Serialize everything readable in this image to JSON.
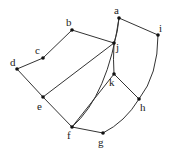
{
  "diagram": {
    "type": "graph",
    "colors": {
      "edge": "#333333",
      "node": "#111111",
      "label": "#222222",
      "background": "#ffffff"
    },
    "nodes": [
      {
        "id": "a",
        "label": "a",
        "x": 119,
        "y": 18,
        "lx": 114,
        "ly": 14
      },
      {
        "id": "b",
        "label": "b",
        "x": 72,
        "y": 30,
        "lx": 66,
        "ly": 26
      },
      {
        "id": "c",
        "label": "c",
        "x": 43,
        "y": 58,
        "lx": 35,
        "ly": 54
      },
      {
        "id": "d",
        "label": "d",
        "x": 17,
        "y": 69,
        "lx": 10,
        "ly": 66
      },
      {
        "id": "e",
        "label": "e",
        "x": 43,
        "y": 97,
        "lx": 37,
        "ly": 110
      },
      {
        "id": "f",
        "label": "f",
        "x": 72,
        "y": 127,
        "lx": 67,
        "ly": 139
      },
      {
        "id": "g",
        "label": "g",
        "x": 103,
        "y": 133,
        "lx": 98,
        "ly": 146
      },
      {
        "id": "h",
        "label": "h",
        "x": 139,
        "y": 99,
        "lx": 140,
        "ly": 111
      },
      {
        "id": "i",
        "label": "i",
        "x": 158,
        "y": 35,
        "lx": 159,
        "ly": 32
      },
      {
        "id": "j",
        "label": "j",
        "x": 114,
        "y": 43,
        "lx": 116,
        "ly": 51
      },
      {
        "id": "k",
        "label": "k",
        "x": 114,
        "y": 74,
        "lx": 109,
        "ly": 86
      }
    ],
    "edges": [
      {
        "from": "a",
        "to": "i",
        "d": "M119,18 L158,35"
      },
      {
        "from": "a",
        "to": "j",
        "d": "M119,18 Q118,32 114,43"
      },
      {
        "from": "b",
        "to": "j",
        "d": "M72,30 L114,43"
      },
      {
        "from": "b",
        "to": "c",
        "d": "M72,30 L43,58"
      },
      {
        "from": "c",
        "to": "d",
        "d": "M43,58 L17,69"
      },
      {
        "from": "d",
        "to": "e",
        "d": "M17,69 L43,97"
      },
      {
        "from": "e",
        "to": "j",
        "d": "M43,97 L114,43"
      },
      {
        "from": "e",
        "to": "f",
        "d": "M43,97 L72,127"
      },
      {
        "from": "j",
        "to": "k",
        "d": "M114,43 Q113,60 114,74"
      },
      {
        "from": "k",
        "to": "f",
        "d": "M114,74 L72,127"
      },
      {
        "from": "k",
        "to": "h",
        "d": "M114,74 L139,99"
      },
      {
        "from": "f",
        "to": "g",
        "d": "M72,127 L103,133"
      },
      {
        "from": "g",
        "to": "h",
        "d": "M103,133 Q125,122 139,99"
      },
      {
        "from": "i",
        "to": "h",
        "d": "M158,35 Q158,75 139,99"
      },
      {
        "from": "a",
        "to": "f",
        "d": "M119,18 Q108,95 72,127"
      }
    ]
  }
}
